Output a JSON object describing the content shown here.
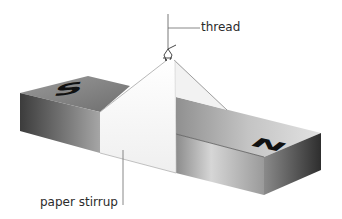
{
  "diagram": {
    "type": "labeled illustration",
    "labels": {
      "thread": "thread",
      "paper_stirrup": "paper stirrup"
    },
    "pole_markings": {
      "left": "S",
      "right": "N"
    },
    "colors": {
      "magnet_top": "#8a8a8a",
      "magnet_front_dark": "#4a4a4a",
      "magnet_front_light": "#c8c8c8",
      "magnet_end_face": "#3e3e3e",
      "stirrup": "#f7f7f7",
      "stirrup_shadow": "#e9e9e9",
      "outline": "#6a6a6a",
      "letter": "#111111",
      "label_text": "#2b2b2b"
    }
  }
}
